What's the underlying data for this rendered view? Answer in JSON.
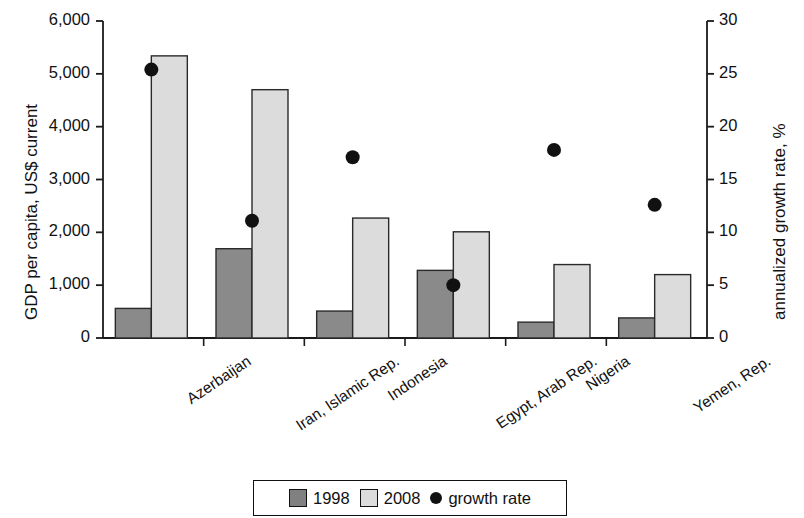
{
  "chart_data": {
    "type": "bar",
    "title": "",
    "categories": [
      "Azerbaijan",
      "Iran, Islamic Rep.",
      "Indonesia",
      "Egypt, Arab Rep.",
      "Nigeria",
      "Yemen, Rep."
    ],
    "series": [
      {
        "name": "1998",
        "values": [
          560,
          1690,
          510,
          1280,
          300,
          380
        ],
        "color": "#808080",
        "axis": "left"
      },
      {
        "name": "2008",
        "values": [
          5340,
          4700,
          2270,
          2010,
          1390,
          1200
        ],
        "color": "#d4d4d4",
        "axis": "left"
      },
      {
        "name": "growth rate",
        "values": [
          25.4,
          11.1,
          17.1,
          5.0,
          17.8,
          12.6
        ],
        "color": "#111111",
        "axis": "right",
        "marker": "circle"
      }
    ],
    "xlabel": "",
    "ylabel": "GDP per capita, US$ current",
    "ylabel_right": "annualized growth rate, %",
    "ylim": [
      0,
      6000
    ],
    "ylim_right": [
      0,
      30
    ],
    "yticks": [
      0,
      1000,
      2000,
      3000,
      4000,
      5000,
      6000
    ],
    "ytick_labels": [
      "0",
      "1,000",
      "2,000",
      "3,000",
      "4,000",
      "5,000",
      "6,000"
    ],
    "yticks_right": [
      0,
      5,
      10,
      15,
      20,
      25,
      30
    ],
    "ytick_labels_right": [
      "0",
      "5",
      "10",
      "15",
      "20",
      "25",
      "30"
    ],
    "grid": false,
    "legend_position": "bottom"
  },
  "legend": {
    "items": [
      {
        "label": "1998",
        "marker": "square",
        "color": "#808080"
      },
      {
        "label": "2008",
        "marker": "square",
        "color": "#d4d4d4"
      },
      {
        "label": "growth rate",
        "marker": "circle",
        "color": "#111111"
      }
    ]
  }
}
